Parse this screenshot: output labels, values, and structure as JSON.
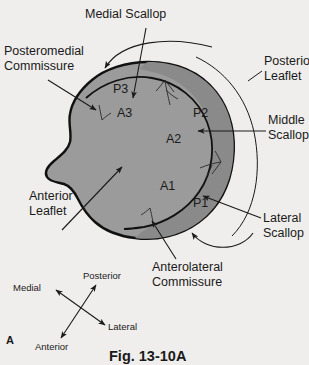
{
  "figure": {
    "caption": "Fig. 13-10A",
    "panel_label": "A",
    "background_color": "#f0eeec",
    "anterior_leaflet_fill": "#9b9b9b",
    "posterior_leaflet_fill": "#8a8a8a",
    "outline_color": "#111111"
  },
  "callouts": {
    "medial_scallop": "Medial Scallop",
    "posteromedial_commissure_line1": "Posteromedial",
    "posteromedial_commissure_line2": "Commissure",
    "posterior_leaflet_line1": "Posterior",
    "posterior_leaflet_line2": "Leaflet",
    "middle_scallop_line1": "Middle",
    "middle_scallop_line2": "Scallop",
    "lateral_scallop_line1": "Lateral",
    "lateral_scallop_line2": "Scallop",
    "anterior_leaflet_line1": "Anterior",
    "anterior_leaflet_line2": "Leaflet",
    "anterolateral_commissure_line1": "Anterolateral",
    "anterolateral_commissure_line2": "Commissure"
  },
  "segments": {
    "p3": "P3",
    "p2": "P2",
    "p1": "P1",
    "a3": "A3",
    "a2": "A2",
    "a1": "A1"
  },
  "compass": {
    "medial": "Medial",
    "lateral": "Lateral",
    "posterior": "Posterior",
    "anterior": "Anterior"
  }
}
